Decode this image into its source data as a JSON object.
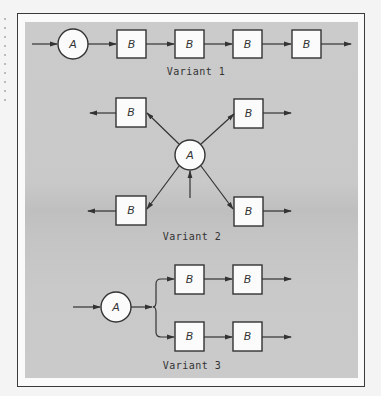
{
  "diagram": {
    "colors": {
      "panel": "#c8c8c8",
      "stroke": "#333333",
      "node_fill": "#fbfbfb",
      "frame": "#3a3a3a"
    },
    "variants": [
      {
        "caption": "Variant 1",
        "layout": "serial chain",
        "nodes": [
          {
            "id": "v1-A",
            "shape": "circle",
            "label": "A"
          },
          {
            "id": "v1-B1",
            "shape": "box",
            "label": "B"
          },
          {
            "id": "v1-B2",
            "shape": "box",
            "label": "B"
          },
          {
            "id": "v1-B3",
            "shape": "box",
            "label": "B"
          },
          {
            "id": "v1-B4",
            "shape": "box",
            "label": "B"
          }
        ],
        "edges": [
          [
            "in",
            "v1-A"
          ],
          [
            "v1-A",
            "v1-B1"
          ],
          [
            "v1-B1",
            "v1-B2"
          ],
          [
            "v1-B2",
            "v1-B3"
          ],
          [
            "v1-B3",
            "v1-B4"
          ],
          [
            "v1-B4",
            "out"
          ]
        ]
      },
      {
        "caption": "Variant 2",
        "layout": "star / radial",
        "nodes": [
          {
            "id": "v2-A",
            "shape": "circle",
            "label": "A"
          },
          {
            "id": "v2-B-tl",
            "shape": "box",
            "label": "B"
          },
          {
            "id": "v2-B-tr",
            "shape": "box",
            "label": "B"
          },
          {
            "id": "v2-B-bl",
            "shape": "box",
            "label": "B"
          },
          {
            "id": "v2-B-br",
            "shape": "box",
            "label": "B"
          }
        ],
        "edges": [
          [
            "in",
            "v2-A"
          ],
          [
            "v2-A",
            "v2-B-tl"
          ],
          [
            "v2-A",
            "v2-B-tr"
          ],
          [
            "v2-A",
            "v2-B-bl"
          ],
          [
            "v2-A",
            "v2-B-br"
          ],
          [
            "v2-B-tl",
            "out"
          ],
          [
            "v2-B-tr",
            "out"
          ],
          [
            "v2-B-bl",
            "out"
          ],
          [
            "v2-B-br",
            "out"
          ]
        ]
      },
      {
        "caption": "Variant 3",
        "layout": "parallel branches",
        "nodes": [
          {
            "id": "v3-A",
            "shape": "circle",
            "label": "A"
          },
          {
            "id": "v3-B-t1",
            "shape": "box",
            "label": "B"
          },
          {
            "id": "v3-B-t2",
            "shape": "box",
            "label": "B"
          },
          {
            "id": "v3-B-b1",
            "shape": "box",
            "label": "B"
          },
          {
            "id": "v3-B-b2",
            "shape": "box",
            "label": "B"
          }
        ],
        "edges": [
          [
            "in",
            "v3-A"
          ],
          [
            "v3-A",
            "v3-B-t1"
          ],
          [
            "v3-A",
            "v3-B-b1"
          ],
          [
            "v3-B-t1",
            "v3-B-t2"
          ],
          [
            "v3-B-b1",
            "v3-B-b2"
          ],
          [
            "v3-B-t2",
            "out"
          ],
          [
            "v3-B-b2",
            "out"
          ]
        ]
      }
    ]
  }
}
